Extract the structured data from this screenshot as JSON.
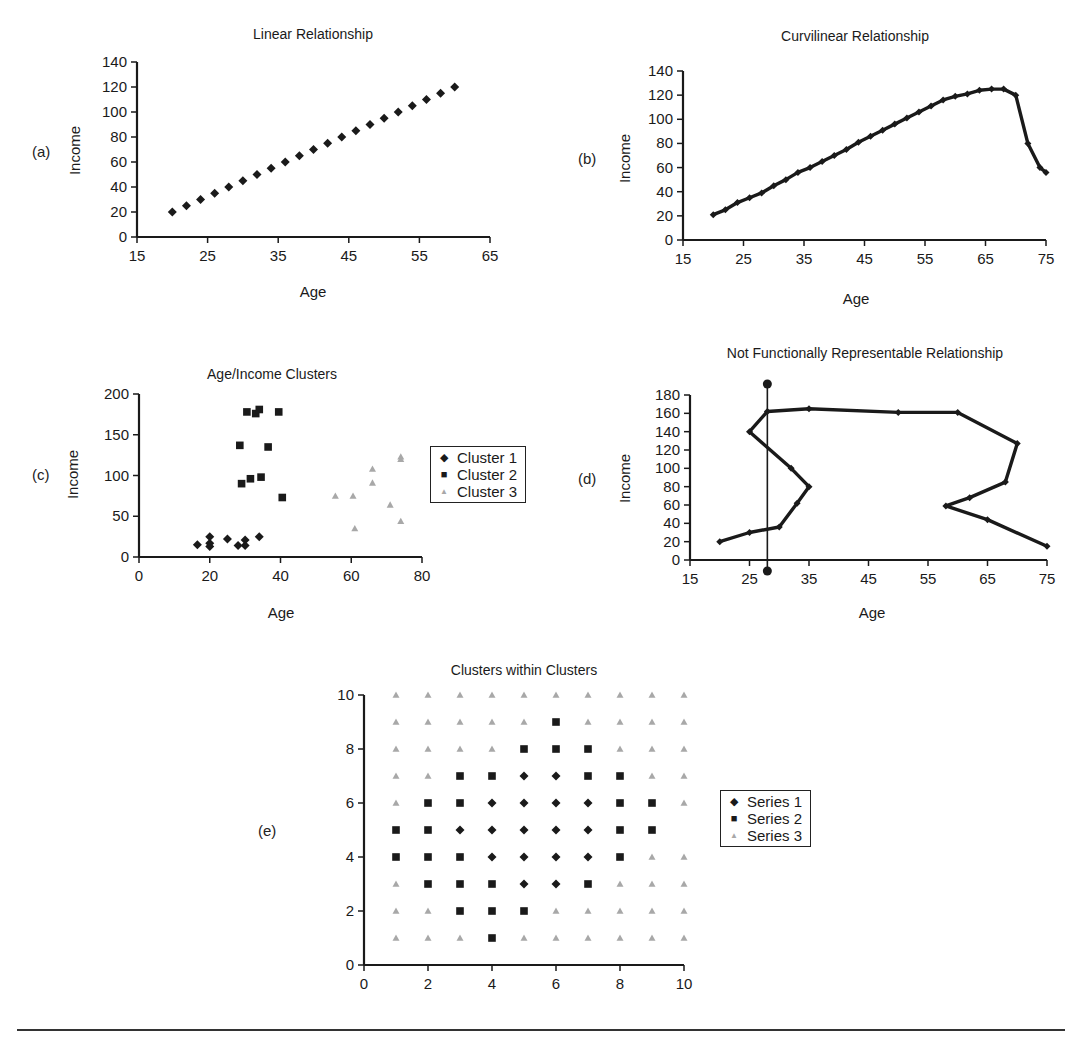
{
  "chart_data": [
    {
      "id": "a",
      "panel_label": "(a)",
      "type": "scatter",
      "title": "Linear Relationship",
      "xlabel": "Age",
      "ylabel": "Income",
      "xlim": [
        15,
        65
      ],
      "ylim": [
        0,
        140
      ],
      "xticks": [
        15,
        25,
        35,
        45,
        55,
        65
      ],
      "yticks": [
        0,
        20,
        40,
        60,
        80,
        100,
        120,
        140
      ],
      "grid": false,
      "series": [
        {
          "name": "Income",
          "marker": "diamond",
          "color": "#1a1a1a",
          "x": [
            20,
            22,
            24,
            26,
            28,
            30,
            32,
            34,
            36,
            38,
            40,
            42,
            44,
            46,
            48,
            50,
            52,
            54,
            56,
            58,
            60
          ],
          "y": [
            20,
            25,
            30,
            35,
            40,
            45,
            50,
            55,
            60,
            65,
            70,
            75,
            80,
            85,
            90,
            95,
            100,
            105,
            110,
            115,
            120
          ]
        }
      ]
    },
    {
      "id": "b",
      "panel_label": "(b)",
      "type": "line",
      "title": "Curvilinear Relationship",
      "xlabel": "Age",
      "ylabel": "Income",
      "xlim": [
        15,
        75
      ],
      "ylim": [
        0,
        140
      ],
      "xticks": [
        15,
        25,
        35,
        45,
        55,
        65,
        75
      ],
      "yticks": [
        0,
        20,
        40,
        60,
        80,
        100,
        120,
        140
      ],
      "grid": false,
      "series": [
        {
          "name": "Income",
          "marker": "diamond",
          "color": "#1a1a1a",
          "x": [
            20,
            22,
            24,
            26,
            28,
            30,
            32,
            34,
            36,
            38,
            40,
            42,
            44,
            46,
            48,
            50,
            52,
            54,
            56,
            58,
            60,
            62,
            64,
            66,
            68,
            70,
            72,
            74,
            75
          ],
          "y": [
            21,
            25,
            31,
            35,
            39,
            45,
            50,
            56,
            60,
            65,
            70,
            75,
            81,
            86,
            91,
            96,
            101,
            106,
            111,
            116,
            119,
            121,
            124,
            125,
            125,
            120,
            80,
            60,
            56
          ]
        }
      ]
    },
    {
      "id": "c",
      "panel_label": "(c)",
      "type": "scatter",
      "title": "Age/Income Clusters",
      "xlabel": "Age",
      "ylabel": "Income",
      "xlim": [
        0,
        80
      ],
      "ylim": [
        0,
        200
      ],
      "xticks": [
        0,
        20,
        40,
        60,
        80
      ],
      "yticks": [
        0,
        50,
        100,
        150,
        200
      ],
      "grid": false,
      "legend_position": "right",
      "series": [
        {
          "name": "Cluster 1",
          "marker": "diamond",
          "color": "#1a1a1a",
          "x": [
            16.5,
            20,
            20,
            20,
            25,
            28,
            30,
            30,
            34
          ],
          "y": [
            15,
            25,
            17,
            13,
            22,
            14,
            21,
            14,
            25
          ]
        },
        {
          "name": "Cluster 2",
          "marker": "square",
          "color": "#1a1a1a",
          "x": [
            30.5,
            33,
            34,
            39.5,
            28.5,
            36.5,
            31.5,
            34.5,
            29,
            40.5
          ],
          "y": [
            178,
            176,
            181,
            178,
            137,
            135,
            96,
            98,
            90,
            73
          ]
        },
        {
          "name": "Cluster 3",
          "marker": "triangle",
          "color": "#a8a8a8",
          "x": [
            55.5,
            60.5,
            66,
            66,
            61,
            71,
            74,
            74,
            74
          ],
          "y": [
            75,
            75,
            108,
            91,
            35,
            64,
            123,
            120,
            44
          ]
        }
      ]
    },
    {
      "id": "d",
      "panel_label": "(d)",
      "type": "line",
      "title": "Not Functionally Representable Relationship",
      "xlabel": "Age",
      "ylabel": "Income",
      "xlim": [
        15,
        75
      ],
      "ylim": [
        0,
        180
      ],
      "xticks": [
        15,
        25,
        35,
        45,
        55,
        65,
        75
      ],
      "yticks": [
        0,
        20,
        40,
        60,
        80,
        100,
        120,
        140,
        160,
        180
      ],
      "grid": false,
      "series": [
        {
          "name": "Income",
          "marker": "diamond",
          "color": "#1a1a1a",
          "x": [
            20,
            25,
            30,
            33,
            35,
            32,
            25,
            28,
            35,
            50,
            60,
            70,
            68,
            62,
            58,
            65,
            75
          ],
          "y": [
            20,
            30,
            36,
            62,
            80,
            100,
            140,
            162,
            165,
            161,
            161,
            127,
            85,
            68,
            59,
            44,
            15
          ]
        }
      ],
      "annotations": [
        {
          "type": "vertical-line",
          "x": 28,
          "y_from": -12,
          "y_to": 192,
          "endpoints": "dot",
          "meaning": "vertical line test"
        }
      ]
    },
    {
      "id": "e",
      "panel_label": "(e)",
      "type": "scatter",
      "title": "Clusters within Clusters",
      "xlabel": "",
      "ylabel": "",
      "xlim": [
        0,
        10
      ],
      "ylim": [
        0,
        10
      ],
      "xticks": [
        0,
        2,
        4,
        6,
        8,
        10
      ],
      "yticks": [
        0,
        2,
        4,
        6,
        8,
        10
      ],
      "grid": false,
      "legend_position": "right",
      "series": [
        {
          "name": "Series 1",
          "marker": "diamond",
          "color": "#1a1a1a",
          "x": [
            5,
            6,
            4,
            5,
            6,
            7,
            3,
            4,
            5,
            6,
            7,
            4,
            5,
            6,
            7,
            5,
            6
          ],
          "y": [
            7,
            7,
            6,
            6,
            6,
            6,
            5,
            5,
            5,
            5,
            5,
            4,
            4,
            4,
            4,
            3,
            3
          ]
        },
        {
          "name": "Series 2",
          "marker": "square",
          "color": "#1a1a1a",
          "x": [
            6,
            5,
            6,
            7,
            3,
            4,
            7,
            8,
            2,
            3,
            8,
            9,
            1,
            2,
            8,
            9,
            1,
            2,
            3,
            8,
            2,
            3,
            4,
            7,
            3,
            4,
            5,
            4
          ],
          "y": [
            9,
            8,
            8,
            8,
            7,
            7,
            7,
            7,
            6,
            6,
            6,
            6,
            5,
            5,
            5,
            5,
            4,
            4,
            4,
            4,
            3,
            3,
            3,
            3,
            2,
            2,
            2,
            1
          ]
        },
        {
          "name": "Series 3",
          "marker": "triangle",
          "color": "#a8a8a8",
          "x": [
            1,
            2,
            3,
            4,
            5,
            6,
            7,
            8,
            9,
            10,
            1,
            2,
            3,
            4,
            5,
            7,
            8,
            9,
            10,
            1,
            2,
            3,
            4,
            8,
            9,
            10,
            1,
            2,
            9,
            10,
            1,
            10,
            9,
            10,
            1,
            8,
            9,
            10,
            1,
            2,
            6,
            7,
            8,
            9,
            10,
            1,
            2,
            3,
            5,
            6,
            7,
            8,
            9,
            10
          ],
          "y": [
            10,
            10,
            10,
            10,
            10,
            10,
            10,
            10,
            10,
            10,
            9,
            9,
            9,
            9,
            9,
            9,
            9,
            9,
            9,
            8,
            8,
            8,
            8,
            8,
            8,
            8,
            7,
            7,
            7,
            7,
            6,
            6,
            4,
            4,
            3,
            3,
            3,
            3,
            2,
            2,
            2,
            2,
            2,
            2,
            2,
            1,
            1,
            1,
            1,
            1,
            1,
            1,
            1,
            1
          ]
        }
      ]
    }
  ]
}
